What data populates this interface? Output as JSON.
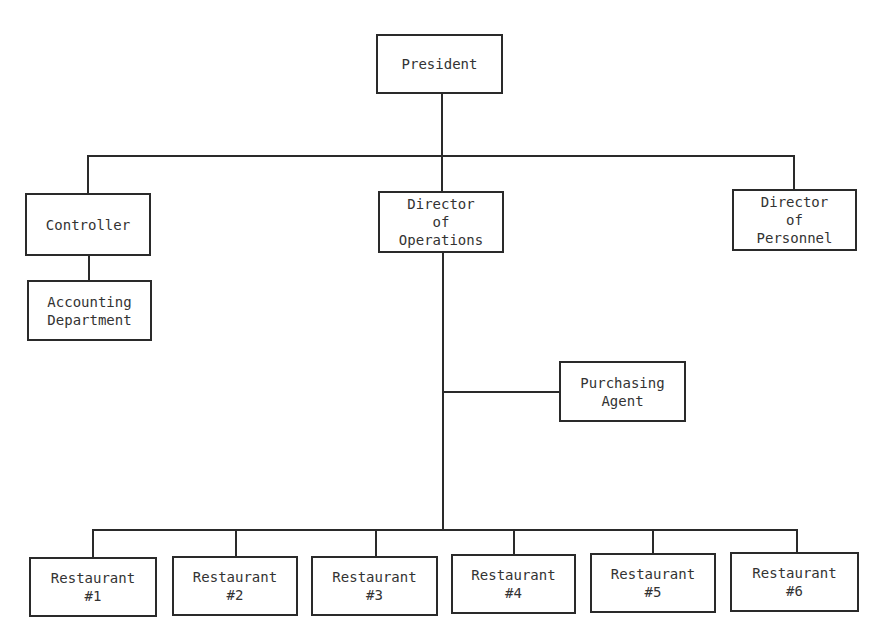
{
  "diagram": {
    "type": "org-chart",
    "colors": {
      "line": "#2a2a2a",
      "text": "#333333",
      "background": "#ffffff"
    },
    "nodes": {
      "president": {
        "lines": [
          "President"
        ]
      },
      "controller": {
        "lines": [
          "Controller"
        ]
      },
      "accounting": {
        "lines": [
          "Accounting",
          "Department"
        ]
      },
      "director_operations": {
        "lines": [
          "Director",
          "of",
          "Operations"
        ]
      },
      "director_personnel": {
        "lines": [
          "Director",
          "of",
          "Personnel"
        ]
      },
      "purchasing": {
        "lines": [
          "Purchasing",
          "Agent"
        ]
      },
      "restaurants": [
        {
          "lines": [
            "Restaurant",
            "#1"
          ]
        },
        {
          "lines": [
            "Restaurant",
            "#2"
          ]
        },
        {
          "lines": [
            "Restaurant",
            "#3"
          ]
        },
        {
          "lines": [
            "Restaurant",
            "#4"
          ]
        },
        {
          "lines": [
            "Restaurant",
            "#5"
          ]
        },
        {
          "lines": [
            "Restaurant",
            "#6"
          ]
        }
      ]
    },
    "edges": [
      [
        "President",
        "Controller"
      ],
      [
        "President",
        "Director of Operations"
      ],
      [
        "President",
        "Director of Personnel"
      ],
      [
        "Controller",
        "Accounting Department"
      ],
      [
        "Director of Operations",
        "Purchasing Agent"
      ],
      [
        "Director of Operations",
        "Restaurant #1"
      ],
      [
        "Director of Operations",
        "Restaurant #2"
      ],
      [
        "Director of Operations",
        "Restaurant #3"
      ],
      [
        "Director of Operations",
        "Restaurant #4"
      ],
      [
        "Director of Operations",
        "Restaurant #5"
      ],
      [
        "Director of Operations",
        "Restaurant #6"
      ]
    ]
  }
}
